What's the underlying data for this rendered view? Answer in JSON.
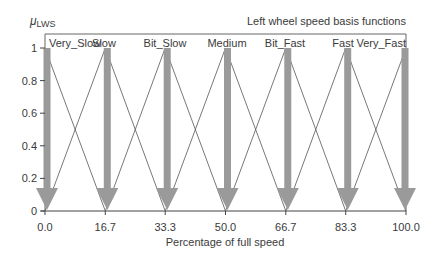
{
  "chart_data": {
    "type": "line",
    "title": "Left wheel speed basis functions",
    "ylabel": "μLWS",
    "ylabel_main": "μ",
    "ylabel_sub": "LWS",
    "xlabel": "Percentage of full speed",
    "xlim": [
      0,
      100
    ],
    "ylim": [
      0,
      1
    ],
    "x_ticks": [
      "0.0",
      "16.7",
      "33.3",
      "50.0",
      "66.7",
      "83.3",
      "100.0"
    ],
    "x_tick_values": [
      0.0,
      16.7,
      33.3,
      50.0,
      66.7,
      83.3,
      100.0
    ],
    "y_ticks": [
      "0",
      "0.2",
      "0.4",
      "0.6",
      "0.8",
      "1"
    ],
    "y_tick_values": [
      0,
      0.2,
      0.4,
      0.6,
      0.8,
      1
    ],
    "grid": false,
    "series": [
      {
        "name": "Very_Slow",
        "points": [
          [
            0.0,
            1
          ],
          [
            16.7,
            0
          ]
        ]
      },
      {
        "name": "Slow",
        "points": [
          [
            0.0,
            0
          ],
          [
            16.7,
            1
          ],
          [
            33.3,
            0
          ]
        ]
      },
      {
        "name": "Bit_Slow",
        "points": [
          [
            16.7,
            0
          ],
          [
            33.3,
            1
          ],
          [
            50.0,
            0
          ]
        ]
      },
      {
        "name": "Medium",
        "points": [
          [
            33.3,
            0
          ],
          [
            50.0,
            1
          ],
          [
            66.7,
            0
          ]
        ]
      },
      {
        "name": "Bit_Fast",
        "points": [
          [
            50.0,
            0
          ],
          [
            66.7,
            1
          ],
          [
            83.3,
            0
          ]
        ]
      },
      {
        "name": "Fast",
        "points": [
          [
            66.7,
            0
          ],
          [
            83.3,
            1
          ],
          [
            100.0,
            0
          ]
        ]
      },
      {
        "name": "Very_Fast",
        "points": [
          [
            83.3,
            0
          ],
          [
            100.0,
            1
          ]
        ]
      }
    ],
    "annotations": "Thick gray downward arrows drawn at each peak (x = 0, 16.7, 33.3, 50, 66.7, 83.3, 100) from μ=1 down to μ=0",
    "colors": {
      "lines": "#555555",
      "arrows": "#9a9a9a",
      "frame": "#666666"
    }
  }
}
